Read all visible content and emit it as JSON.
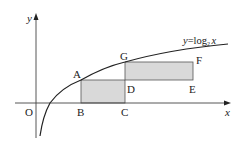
{
  "diagram": {
    "function_label": {
      "y": "y",
      "eq": "=",
      "log": "log",
      "base": "2",
      "x": "x"
    },
    "axes": {
      "x_label": "x",
      "y_label": "y",
      "origin_label": "O"
    },
    "points": {
      "A": "A",
      "B": "B",
      "C": "C",
      "D": "D",
      "E": "E",
      "F": "F",
      "G": "G"
    },
    "rectangles": [
      {
        "name": "ABCD",
        "vertices": [
          "A",
          "B",
          "C",
          "D"
        ]
      },
      {
        "name": "GDEF",
        "vertices": [
          "G",
          "D",
          "E",
          "F"
        ]
      }
    ],
    "colors": {
      "stroke": "#222222",
      "fill": "#d9d9d9",
      "axis": "#444444"
    }
  }
}
